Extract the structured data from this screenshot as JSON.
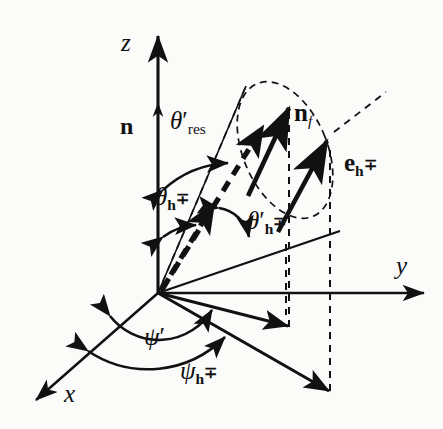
{
  "figure": {
    "type": "vector-geometry-diagram",
    "background_color": "#fbfbfa",
    "line_color": "#111111"
  },
  "axes": {
    "x": {
      "label": "x",
      "style": "italic"
    },
    "y": {
      "label": "y",
      "style": "italic"
    },
    "z": {
      "label": "z",
      "style": "italic"
    }
  },
  "vectors": {
    "n": {
      "base": "n",
      "sub": "",
      "bold": true
    },
    "n_f": {
      "base": "n",
      "sub": "f",
      "sub_style": "italic",
      "bold": true
    },
    "e_h": {
      "base": "e",
      "sub": "h",
      "sub_sup": "∓",
      "sub_style": "bold",
      "bold": true
    }
  },
  "angles": {
    "theta_res": {
      "base": "θ",
      "prime": "′",
      "sub": "res",
      "sub_style": "roman"
    },
    "theta_h": {
      "base": "θ",
      "prime": "",
      "sub": "h",
      "sub_sup": "∓",
      "sub_style": "bold"
    },
    "theta_h_prime": {
      "base": "θ",
      "prime": "′",
      "sub": "h",
      "sub_sup": "∓",
      "sub_style": "bold"
    },
    "psi_prime": {
      "base": "ψ",
      "prime": "′",
      "sub": "",
      "sub_style": ""
    },
    "psi_h": {
      "base": "ψ",
      "prime": "",
      "sub": "h",
      "sub_sup": "∓",
      "sub_style": "bold"
    }
  },
  "glyphs": {
    "mp": "∓",
    "prime": "′",
    "theta": "θ",
    "psi": "ψ"
  }
}
